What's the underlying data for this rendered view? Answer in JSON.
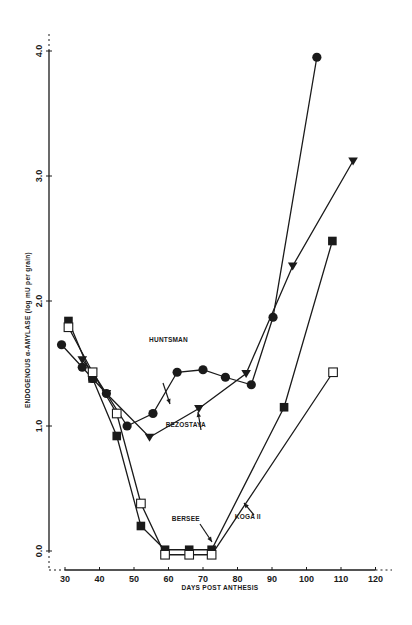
{
  "chart_data": {
    "type": "line",
    "title": "",
    "xlabel": "DAYS POST ANTHESIS",
    "ylabel": "ENDOGENOUS α-AMYLASE (log mU per grain)",
    "xlim": [
      27,
      123
    ],
    "ylim": [
      -0.15,
      4.1
    ],
    "x_ticks": [
      30,
      40,
      50,
      60,
      70,
      80,
      90,
      100,
      110,
      120
    ],
    "y_ticks": [
      0.0,
      1.0,
      2.0,
      3.0,
      4.0
    ],
    "y_tick_labels": [
      "0.0",
      "1.0",
      "2.0",
      "3.0",
      "4.0"
    ],
    "grid": false,
    "legend": "inline labels with arrows",
    "series": [
      {
        "name": "HUNTSMAN",
        "marker": "filled-circle",
        "x": [
          29,
          35,
          38,
          42,
          48,
          55.5,
          62.5,
          70,
          76.5,
          84,
          90.3,
          103
        ],
        "values": [
          1.65,
          1.47,
          1.38,
          1.26,
          1.0,
          1.1,
          1.43,
          1.45,
          1.39,
          1.33,
          1.87,
          3.95
        ]
      },
      {
        "name": "BEZOSTAYA",
        "marker": "filled-triangle-down",
        "x": [
          35,
          38,
          42,
          54.5,
          68.8,
          82.5,
          96,
          113.5
        ],
        "values": [
          1.53,
          1.43,
          1.26,
          0.91,
          1.14,
          1.42,
          2.28,
          3.12
        ]
      },
      {
        "name": "BERSEE",
        "marker": "filled-square",
        "x": [
          31,
          38,
          45,
          52,
          59,
          66,
          72.5,
          93.5,
          107.5
        ],
        "values": [
          1.84,
          1.38,
          0.92,
          0.2,
          0.01,
          0.01,
          0.01,
          1.15,
          2.48
        ]
      },
      {
        "name": "KOGA II",
        "marker": "open-square",
        "x": [
          31,
          38,
          45,
          52,
          59,
          66,
          72.5,
          107.7
        ],
        "values": [
          1.79,
          1.43,
          1.1,
          0.38,
          -0.03,
          -0.03,
          -0.03,
          1.43
        ]
      }
    ],
    "annotations": [
      {
        "text": "HUNTSMAN",
        "x": 60,
        "y": 1.67
      },
      {
        "text": "BEZOSTAYA",
        "x": 65,
        "y": 0.99
      },
      {
        "text": "BERSEE",
        "x": 65,
        "y": 0.24
      },
      {
        "text": "KOGA II",
        "x": 83,
        "y": 0.26
      }
    ],
    "colors": {
      "ink": "#1a1a1a",
      "background": "#ffffff"
    }
  }
}
